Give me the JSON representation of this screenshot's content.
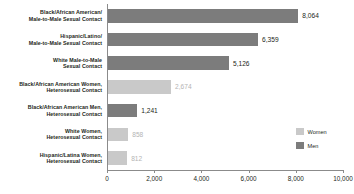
{
  "chart_data": {
    "type": "bar",
    "orientation": "horizontal",
    "title": "",
    "subtitle": "",
    "xlabel": "",
    "ylabel": "",
    "xlim": [
      0,
      10000
    ],
    "xticks": [
      0,
      2000,
      4000,
      6000,
      8000,
      10000
    ],
    "xtick_labels": [
      "0",
      "2,000",
      "4,000",
      "6,000",
      "8,000",
      "10,000"
    ],
    "grid": false,
    "legend_position": "bottom-right",
    "legend": [
      {
        "name": "Women",
        "color": "#c9c9c9"
      },
      {
        "name": "Men",
        "color": "#7c7c7c"
      }
    ],
    "categories": [
      "Black/African American/ Male-to-Male Sexual Contact",
      "Hispanic/Latino/ Male-to-Male Sexual Contact",
      "White Male-to-Male Sexual Contact",
      "Black/African American Women, Heterosexual Contact",
      "Black/African American Men, Heterosexual Contact",
      "White Women, Heterosexual Contact",
      "Hispanic/Latina Women, Heterosexual Contact"
    ],
    "values": [
      8064,
      6359,
      5126,
      2674,
      1241,
      858,
      812
    ],
    "bars": [
      {
        "label_lines": [
          "Black/African American/",
          "Male-to-Male Sexual Contact"
        ],
        "value": 8064,
        "value_label": "8,064",
        "group": "Men",
        "color": "#7c7c7c"
      },
      {
        "label_lines": [
          "Hispanic/Latino/",
          "Male-to-Male Sexual Contact"
        ],
        "value": 6359,
        "value_label": "6,359",
        "group": "Men",
        "color": "#7c7c7c"
      },
      {
        "label_lines": [
          "White Male-to-Male",
          "Sexual Contact"
        ],
        "value": 5126,
        "value_label": "5,126",
        "group": "Men",
        "color": "#7c7c7c"
      },
      {
        "label_lines": [
          "Black/African American Women,",
          "Heterosexual Contact"
        ],
        "value": 2674,
        "value_label": "2,674",
        "group": "Women",
        "color": "#c9c9c9"
      },
      {
        "label_lines": [
          "Black/African American Men,",
          "Heterosexual Contact"
        ],
        "value": 1241,
        "value_label": "1,241",
        "group": "Men",
        "color": "#7c7c7c"
      },
      {
        "label_lines": [
          "White Women,",
          "Heterosexual Contact"
        ],
        "value": 858,
        "value_label": "858",
        "group": "Women",
        "color": "#c9c9c9"
      },
      {
        "label_lines": [
          "Hispanic/Latina Women,",
          "Heterosexual Contact"
        ],
        "value": 812,
        "value_label": "812",
        "group": "Women",
        "color": "#c9c9c9"
      }
    ]
  }
}
